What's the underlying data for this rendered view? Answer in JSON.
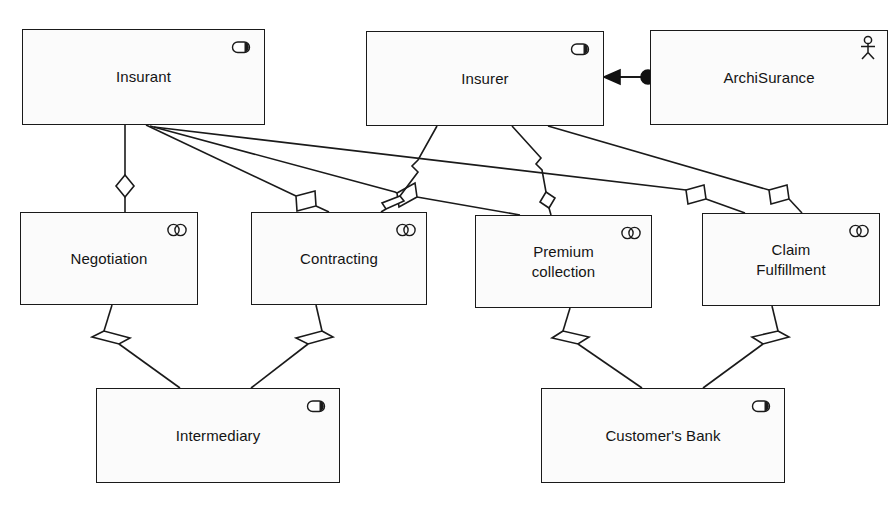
{
  "diagram": {
    "background": "#ffffff",
    "stroke": "#1a1a1a",
    "fill": "#fbfbfb",
    "width": 894,
    "height": 505
  },
  "nodes": [
    {
      "id": "insurant",
      "label": "Insurant",
      "icon": "business-role-icon",
      "type": "Business Role",
      "x": 22,
      "y": 29,
      "w": 243,
      "h": 96
    },
    {
      "id": "insurer",
      "label": "Insurer",
      "icon": "business-role-icon",
      "type": "Business Role",
      "x": 366,
      "y": 31,
      "w": 238,
      "h": 95
    },
    {
      "id": "archisurance",
      "label": "ArchiSurance",
      "icon": "business-actor-icon",
      "type": "Business Actor",
      "x": 650,
      "y": 30,
      "w": 238,
      "h": 95
    },
    {
      "id": "negotiation",
      "label": "Negotiation",
      "icon": "business-collaboration-icon",
      "type": "Business Collaboration",
      "x": 20,
      "y": 212,
      "w": 178,
      "h": 93
    },
    {
      "id": "contracting",
      "label": "Contracting",
      "icon": "business-collaboration-icon",
      "type": "Business Collaboration",
      "x": 251,
      "y": 212,
      "w": 176,
      "h": 93
    },
    {
      "id": "premium-collection",
      "label": "Premium\ncollection",
      "icon": "business-collaboration-icon",
      "type": "Business Collaboration",
      "x": 475,
      "y": 215,
      "w": 177,
      "h": 93
    },
    {
      "id": "claim-fulfillment",
      "label": "Claim\nFulfillment",
      "icon": "business-collaboration-icon",
      "type": "Business Collaboration",
      "x": 702,
      "y": 213,
      "w": 178,
      "h": 93
    },
    {
      "id": "intermediary",
      "label": "Intermediary",
      "icon": "business-role-icon",
      "type": "Business Role",
      "x": 96,
      "y": 388,
      "w": 244,
      "h": 95
    },
    {
      "id": "customers-bank",
      "label": "Customer's Bank",
      "icon": "business-role-icon",
      "type": "Business Role",
      "x": 541,
      "y": 388,
      "w": 244,
      "h": 95
    }
  ],
  "edges": [
    {
      "id": "archisurance-to-insurer",
      "from": "archisurance",
      "to": "insurer",
      "relationship": "assignment",
      "marker_source": "ball",
      "marker_target": "arrow"
    },
    {
      "id": "insurant-to-negotiation",
      "from": "insurant",
      "to": "negotiation",
      "relationship": "aggregation",
      "marker_source": "diamond"
    },
    {
      "id": "insurant-to-contracting",
      "from": "insurant",
      "to": "contracting",
      "relationship": "aggregation",
      "marker_source": "diamond"
    },
    {
      "id": "insurant-to-premium-collection",
      "from": "insurant",
      "to": "premium-collection",
      "relationship": "aggregation",
      "marker_source": "diamond"
    },
    {
      "id": "insurant-to-claim-fulfillment",
      "from": "insurant",
      "to": "claim-fulfillment",
      "relationship": "aggregation",
      "marker_source": "diamond"
    },
    {
      "id": "insurer-to-contracting",
      "from": "insurer",
      "to": "contracting",
      "relationship": "aggregation",
      "marker_source": "diamond"
    },
    {
      "id": "insurer-to-premium-collection",
      "from": "insurer",
      "to": "premium-collection",
      "relationship": "aggregation",
      "marker_source": "diamond"
    },
    {
      "id": "insurer-to-claim-fulfillment",
      "from": "insurer",
      "to": "claim-fulfillment",
      "relationship": "aggregation",
      "marker_source": "diamond"
    },
    {
      "id": "negotiation-to-intermediary",
      "from": "negotiation",
      "to": "intermediary",
      "relationship": "aggregation",
      "marker_source": "diamond"
    },
    {
      "id": "contracting-to-intermediary",
      "from": "contracting",
      "to": "intermediary",
      "relationship": "aggregation",
      "marker_source": "diamond"
    },
    {
      "id": "premium-collection-to-customers-bank",
      "from": "premium-collection",
      "to": "customers-bank",
      "relationship": "aggregation",
      "marker_source": "diamond"
    },
    {
      "id": "claim-fulfillment-to-customers-bank",
      "from": "claim-fulfillment",
      "to": "customers-bank",
      "relationship": "aggregation",
      "marker_source": "diamond"
    }
  ]
}
